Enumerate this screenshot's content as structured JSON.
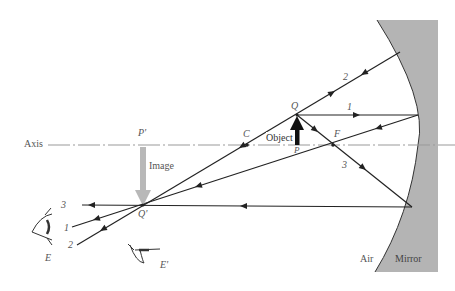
{
  "figure": {
    "axis_label": "Axis",
    "points": {
      "Q": "Q",
      "P": "P",
      "P_prime": "P'",
      "Q_prime": "Q'",
      "C": "C",
      "F": "F"
    },
    "object_label": "Object",
    "image_label": "Image",
    "rays": [
      {
        "id": "1",
        "label": "1",
        "description": "Parallel ray reflects through F"
      },
      {
        "id": "2",
        "label": "2",
        "description": "Ray through C reflects back on itself"
      },
      {
        "id": "3",
        "label": "3",
        "description": "Ray through F reflects parallel to axis"
      }
    ],
    "observers": {
      "E": "E",
      "E_prime": "E'"
    },
    "media": {
      "air": "Air",
      "mirror": "Mirror"
    },
    "colors": {
      "mirror_fill": "#b4b4b4",
      "ray": "#222222",
      "image_arrow": "#b8b8b8",
      "object_arrow": "#111111",
      "axis": "#999999"
    }
  }
}
